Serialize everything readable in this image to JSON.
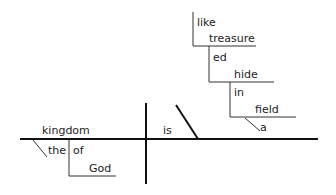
{
  "diagram": {
    "type": "sentence-diagram",
    "subject": "kingdom",
    "verb": "is",
    "subject_modifiers": {
      "article": "the",
      "preposition": "of",
      "prep_object": "God"
    },
    "predicate": {
      "linking_word": "like",
      "complement": "treasure",
      "participle_suffix": "ed",
      "participle": "hide",
      "preposition": "in",
      "prep_object": "field",
      "article": "a"
    },
    "colors": {
      "line": "#111111",
      "thin_line": "#333333",
      "text": "#222222"
    }
  }
}
